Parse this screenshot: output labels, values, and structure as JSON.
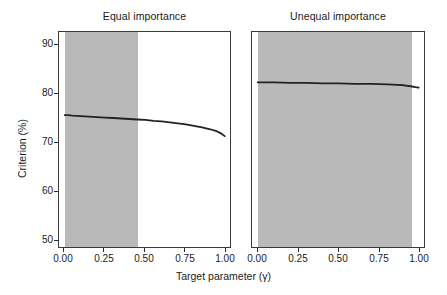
{
  "chart_data": {
    "type": "line",
    "title": "",
    "xlabel": "Target parameter (γ)",
    "ylabel": "Criterion (%)",
    "xlim": [
      -0.035,
      1.035
    ],
    "ylim": [
      47.8,
      92.2
    ],
    "xticks": [
      0.0,
      0.25,
      0.5,
      0.75,
      1.0
    ],
    "xtick_labels": [
      "0.00",
      "0.25",
      "0.50",
      "0.75",
      "1.00"
    ],
    "yticks": [
      50,
      60,
      70,
      80,
      90
    ],
    "ytick_labels": [
      "50",
      "60",
      "70",
      "80",
      "90"
    ],
    "grid": false,
    "legend": "none",
    "facets": [
      {
        "label": "Equal importance",
        "shaded_region": {
          "x_start": 0.0,
          "x_end": 0.452,
          "color": "#b9b9b9"
        },
        "series": [
          {
            "name": "criterion",
            "color": "#222222",
            "x": [
              0.0,
              0.02,
              0.05,
              0.1,
              0.15,
              0.2,
              0.25,
              0.3,
              0.35,
              0.4,
              0.45,
              0.5,
              0.55,
              0.6,
              0.65,
              0.7,
              0.75,
              0.8,
              0.85,
              0.9,
              0.94,
              0.97,
              0.99
            ],
            "y": [
              75.2,
              75.2,
              75.1,
              75.0,
              74.9,
              74.8,
              74.7,
              74.6,
              74.5,
              74.4,
              74.3,
              74.2,
              74.0,
              73.9,
              73.7,
              73.5,
              73.3,
              73.0,
              72.7,
              72.3,
              71.9,
              71.4,
              70.9
            ]
          }
        ]
      },
      {
        "label": "Unequal importance",
        "shaded_region": {
          "x_start": 0.0,
          "x_end": 0.952,
          "color": "#b9b9b9"
        },
        "series": [
          {
            "name": "criterion",
            "color": "#222222",
            "x": [
              0.0,
              0.05,
              0.1,
              0.2,
              0.3,
              0.4,
              0.5,
              0.6,
              0.7,
              0.8,
              0.86,
              0.9,
              0.94,
              0.97,
              0.99
            ],
            "y": [
              81.9,
              81.9,
              81.9,
              81.8,
              81.8,
              81.7,
              81.7,
              81.6,
              81.6,
              81.5,
              81.4,
              81.3,
              81.1,
              80.9,
              80.8
            ]
          }
        ]
      }
    ]
  },
  "axes": {
    "y_label": "Criterion (%)",
    "x_label": "Target parameter (γ)",
    "y_tick_labels": [
      "90",
      "80",
      "70",
      "60",
      "50"
    ],
    "x_tick_labels": [
      "0.00",
      "0.25",
      "0.50",
      "0.75",
      "1.00"
    ]
  },
  "panels": {
    "left_title": "Equal importance",
    "right_title": "Unequal importance"
  },
  "colors": {
    "shade": "#b9b9b9",
    "curve": "#222222",
    "axis": "#3a3a3a",
    "background": "#ffffff"
  }
}
